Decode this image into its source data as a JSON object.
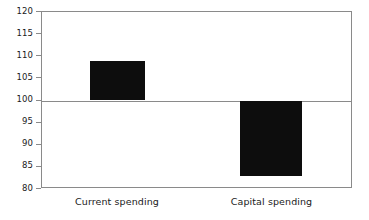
{
  "chart_data": {
    "type": "bar",
    "title": "",
    "subtitle": "",
    "xlabel": "",
    "ylabel": "",
    "categories": [
      "Current spending",
      "Capital spending"
    ],
    "values": [
      109,
      83
    ],
    "baseline": 100,
    "ylim": [
      80,
      120
    ],
    "yticks": [
      80,
      85,
      90,
      95,
      100,
      105,
      110,
      115,
      120
    ],
    "ytick_labels": [
      "80",
      "85",
      "90",
      "95",
      "100",
      "105",
      "110",
      "115",
      "120"
    ],
    "grid": false,
    "legend": null,
    "annotations": [],
    "series": [
      {
        "name": "Spending index",
        "values": [
          109,
          83
        ],
        "color": "#0d0d0d"
      }
    ]
  },
  "style": {
    "bar_color": "#0d0d0d",
    "axis_color": "#8a8a8a",
    "text_color": "#1a1a1a",
    "background": "#ffffff"
  },
  "axis": {
    "y_labels": [
      {
        "text": "120",
        "value": 120
      },
      {
        "text": "115",
        "value": 115
      },
      {
        "text": "110",
        "value": 110
      },
      {
        "text": "105",
        "value": 105
      },
      {
        "text": "100",
        "value": 100
      },
      {
        "text": "95",
        "value": 95
      },
      {
        "text": "90",
        "value": 90
      },
      {
        "text": "85",
        "value": 85
      },
      {
        "text": "80",
        "value": 80
      }
    ]
  },
  "bars": [
    {
      "label": "Current spending",
      "value": 109,
      "left_pct": 15.43,
      "width_pct": 18.01
    },
    {
      "label": "Capital spending",
      "value": 83,
      "left_pct": 63.99,
      "width_pct": 20.26
    }
  ]
}
